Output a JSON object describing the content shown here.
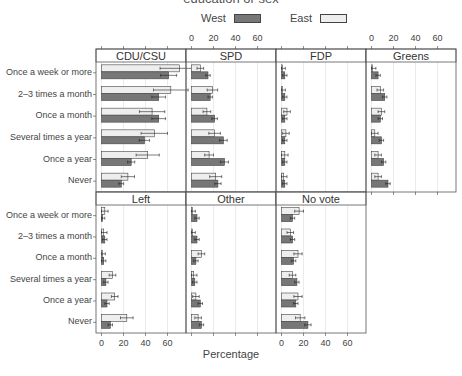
{
  "figure": {
    "title_partial": "education or sex",
    "xlabel": "Percentage",
    "legend": [
      {
        "label": "West",
        "color": "#777777"
      },
      {
        "label": "East",
        "color": "#eeeeee"
      }
    ],
    "colors": {
      "west": "#777777",
      "east": "#eeeeee",
      "grid": "#dddddd",
      "frame": "#555555",
      "strip": "#ffffff"
    }
  },
  "chart_data": {
    "type": "bar",
    "orientation": "horizontal",
    "title": "",
    "xlabel": "Percentage",
    "ylabel": "",
    "xlim": [
      -5,
      77
    ],
    "xticks": [
      0,
      20,
      40,
      60
    ],
    "grid": true,
    "legend_position": "top",
    "categories": [
      "Once a week or more",
      "2–3 times a month",
      "Once a month",
      "Several times a year",
      "Once a year",
      "Never"
    ],
    "series_names": [
      "West",
      "East"
    ],
    "panels": [
      {
        "name": "CDU/CSU",
        "West": [
          61,
          52,
          52,
          39,
          27,
          18
        ],
        "East": [
          71,
          63,
          46,
          48,
          42,
          24
        ]
      },
      {
        "name": "SPD",
        "West": [
          15,
          17,
          21,
          29,
          30,
          24
        ],
        "East": [
          8,
          19,
          14,
          21,
          16,
          22
        ]
      },
      {
        "name": "FDP",
        "West": [
          3,
          3,
          3,
          3,
          3,
          3
        ],
        "East": [
          0.5,
          0.5,
          5,
          4,
          3,
          2
        ]
      },
      {
        "name": "Greens",
        "West": [
          6,
          12,
          8,
          9,
          11,
          15
        ],
        "East": [
          1,
          8,
          9,
          3,
          6,
          6
        ]
      },
      {
        "name": "Left",
        "West": [
          1,
          3,
          2,
          4,
          5,
          8
        ],
        "East": [
          3,
          2,
          0.5,
          10,
          12,
          23
        ]
      },
      {
        "name": "Other",
        "West": [
          5,
          5,
          4,
          3,
          8,
          9
        ],
        "East": [
          0.5,
          0.5,
          9,
          2,
          4,
          6
        ]
      },
      {
        "name": "No vote",
        "West": [
          10,
          10,
          11,
          14,
          13,
          24
        ],
        "East": [
          16,
          8,
          15,
          10,
          15,
          17
        ]
      }
    ]
  }
}
